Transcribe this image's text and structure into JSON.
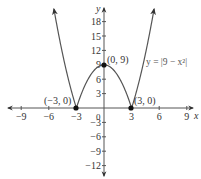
{
  "chart_data": {
    "type": "line",
    "title": "",
    "xlabel": "x",
    "ylabel": "y",
    "xlim": [
      -9.9,
      9.6
    ],
    "ylim": [
      -14,
      21
    ],
    "x_ticks": [
      -9,
      -6,
      -3,
      3,
      6,
      9
    ],
    "y_ticks": [
      18,
      15,
      12,
      9,
      6,
      3,
      -3,
      -6,
      -9,
      -12
    ],
    "origin_label": "0",
    "grid": false,
    "series": [
      {
        "name": "y = |9 − x²|",
        "function": "abs(9 - x^2)",
        "x": [
          -5.4,
          -5,
          -4,
          -3,
          -2,
          -1,
          0,
          1,
          2,
          3,
          4,
          5,
          5.4
        ],
        "values": [
          20.16,
          16,
          7,
          0,
          5,
          8,
          9,
          8,
          5,
          0,
          7,
          16,
          20.16
        ],
        "color": "#555555"
      }
    ],
    "annotations": [
      {
        "label": "(0, 9)",
        "x": 0,
        "y": 9
      },
      {
        "label": "(−3, 0)",
        "x": -3,
        "y": 0
      },
      {
        "label": "(3, 0)",
        "x": 3,
        "y": 0
      }
    ],
    "equation_label": "y = |9 − x²|"
  },
  "labels": {
    "x_axis": "x",
    "y_axis": "y",
    "origin": "0",
    "equation": "y = |9 − x²|",
    "points": [
      "(0, 9)",
      "(−3, 0)",
      "(3, 0)"
    ],
    "x_ticks": [
      "−9",
      "−6",
      "−3",
      "3",
      "6",
      "9"
    ],
    "y_ticks": [
      "18",
      "15",
      "12",
      "9",
      "6",
      "3",
      "−3",
      "−6",
      "−9",
      "−12"
    ]
  }
}
